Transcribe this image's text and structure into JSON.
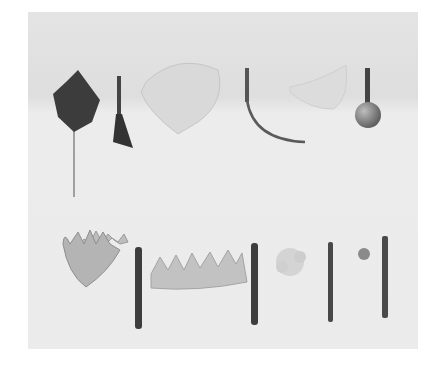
{
  "image": {
    "description": "Grayscale photograph of flower-making tools and petal cutouts arranged in two rows on a light background",
    "top_row": [
      "dark leaf on wire",
      "small blade tool",
      "pale petal",
      "curved hook tool",
      "translucent petal",
      "ball tool"
    ],
    "bottom_row": [
      "pointed multi-petal cutout",
      "rod tool",
      "fringed strip",
      "rod tool",
      "small flower cluster",
      "thin rod tool",
      "tiny flower",
      "thin rod tool"
    ],
    "colors": {
      "background": "#e9e9e9",
      "dark": "#3a3a3a",
      "metal": "#555555",
      "petal": "#d8d8d8"
    }
  }
}
